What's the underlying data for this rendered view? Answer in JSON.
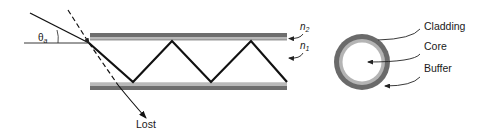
{
  "diagram": {
    "type": "optical-fiber-total-internal-reflection",
    "labels": {
      "theta": "θ",
      "theta_sub": "a",
      "n2": "n",
      "n2_sub": "2",
      "n1": "n",
      "n1_sub": "1",
      "lost": "Lost",
      "cladding": "Cladding",
      "core": "Core",
      "buffer": "Buffer"
    },
    "colors": {
      "line": "#111111",
      "bar_dark": "#6e6e6e",
      "bar_light": "#b9b9b9",
      "ring_outer": "#6a6a6a",
      "ring_inner": "#b4b4b4",
      "background": "#ffffff"
    }
  }
}
